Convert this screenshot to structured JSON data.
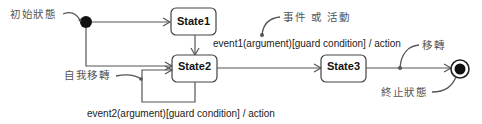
{
  "diagram": {
    "type": "uml-state-machine",
    "states": [
      {
        "id": "state1",
        "label": "State1"
      },
      {
        "id": "state2",
        "label": "State2"
      },
      {
        "id": "state3",
        "label": "State3"
      }
    ],
    "transitions": [
      {
        "from": "initial",
        "to": "state1",
        "label": ""
      },
      {
        "from": "state1",
        "to": "state2",
        "label": ""
      },
      {
        "from": "initial",
        "to": "state2",
        "label": ""
      },
      {
        "from": "state2",
        "to": "state3",
        "label": "event1(argument)[guard condition] / action"
      },
      {
        "from": "state2",
        "to": "state2",
        "label": "event2(argument)[guard condition] / action"
      },
      {
        "from": "state3",
        "to": "final",
        "label": ""
      }
    ],
    "annotations": {
      "initial_state": "初始狀態",
      "event_or_activity": "事件 或 活動",
      "self_transition": "自我移轉",
      "transition": "移轉",
      "final_state": "終止狀態"
    },
    "colors": {
      "line": "#555555",
      "box_border": "#444444",
      "node_fill": "#111111",
      "annotation_text": "#555555"
    }
  }
}
